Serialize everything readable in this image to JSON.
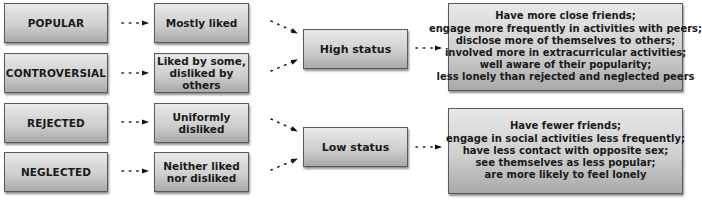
{
  "diagram": {
    "categories": [
      {
        "label": "POPULAR",
        "liking": "Mostly liked",
        "status": "high"
      },
      {
        "label": "CONTROVERSIAL",
        "liking": "Liked by some, disliked by others",
        "liking_lines": [
          "Liked by some,",
          "disliked by others"
        ],
        "status": "high"
      },
      {
        "label": "REJECTED",
        "liking": "Uniformly disliked",
        "status": "low"
      },
      {
        "label": "NEGLECTED",
        "liking": "Neither liked nor disliked",
        "liking_lines": [
          "Neither liked",
          "nor disliked"
        ],
        "status": "low"
      }
    ],
    "status": {
      "high": {
        "label": "High status",
        "outcomes": [
          "Have more close friends;",
          "engage more frequently in activities with peers;",
          "disclose more of themselves to others;",
          "involved more in extracurricular activities;",
          "well aware of their popularity;",
          "less lonely than rejected and neglected peers"
        ]
      },
      "low": {
        "label": "Low status",
        "outcomes": [
          "Have fewer friends;",
          "engage in social activities less frequently;",
          "have less contact with opposite sex;",
          "see themselves as less popular;",
          "are more likely to feel lonely"
        ]
      }
    },
    "connector_style": "dotted-arrow",
    "colors": {
      "box_top": "#e8e8e8",
      "box_bottom": "#a9a9a9",
      "border": "#5a5a5a",
      "text": "#1a1a1a"
    }
  }
}
